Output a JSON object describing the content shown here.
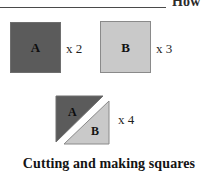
{
  "header": {
    "running_head": "How",
    "rule": "horizontal-rule"
  },
  "figure": {
    "pieces": [
      {
        "id": "square-a",
        "label": "A",
        "multiplier": "x 2",
        "shape": "square",
        "fill": "#5b5b5b",
        "stroke": "#6e6e6e"
      },
      {
        "id": "square-b",
        "label": "B",
        "multiplier": "x 3",
        "shape": "square",
        "fill": "#c9c9c9",
        "stroke": "#8a8a8a"
      }
    ],
    "composite": {
      "id": "split-square",
      "multiplier": "x 4",
      "shape": "square-split-diagonally",
      "triangles": [
        {
          "id": "triangle-a",
          "label": "A",
          "position": "upper-left",
          "fill": "#5b5b5b",
          "stroke": "#6e6e6e"
        },
        {
          "id": "triangle-b",
          "label": "B",
          "position": "lower-right",
          "fill": "#c9c9c9",
          "stroke": "#8a8a8a"
        }
      ],
      "gap_color": "#ffffff"
    }
  },
  "caption": {
    "text": "Cutting and making squares"
  }
}
